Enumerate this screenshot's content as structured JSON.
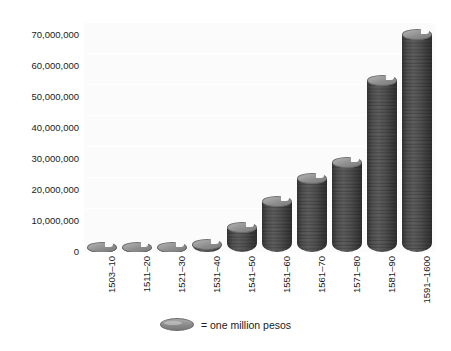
{
  "chart_data": {
    "type": "bar",
    "title": "",
    "subtitle": "",
    "xlabel": "",
    "ylabel": "",
    "categories": [
      "1503–10",
      "1511–20",
      "1521–30",
      "1531–40",
      "1541–50",
      "1551–60",
      "1561–70",
      "1571–80",
      "1581–90",
      "1591–1600"
    ],
    "values": [
      1000000,
      2000000,
      2000000,
      4000000,
      9000000,
      17000000,
      24000000,
      29000000,
      54000000,
      68000000
    ],
    "ylim": [
      0,
      70000000
    ],
    "ytick_values": [
      0,
      10000000,
      20000000,
      30000000,
      40000000,
      50000000,
      60000000,
      70000000
    ],
    "ytick_labels": [
      "0",
      "10,000,000",
      "20,000,000",
      "30,000,000",
      "40,000,000",
      "50,000,000",
      "60,000,000",
      "70,000,000"
    ],
    "grid": true,
    "legend_position": "bottom",
    "legend": [
      {
        "symbol": "coin-disc-icon",
        "label": "= one million pesos"
      }
    ],
    "series": [
      {
        "name": "pesos",
        "unit": "one million pesos per coin",
        "values": [
          1000000,
          2000000,
          2000000,
          4000000,
          9000000,
          17000000,
          24000000,
          29000000,
          54000000,
          68000000
        ]
      }
    ],
    "colors": {
      "bar_fill": "#8a8a8a",
      "bar_edge": "#5f5f5f",
      "plot_background": "#fbfbfb",
      "gridline": "#ffffff",
      "text": "#1a1a1a"
    }
  }
}
